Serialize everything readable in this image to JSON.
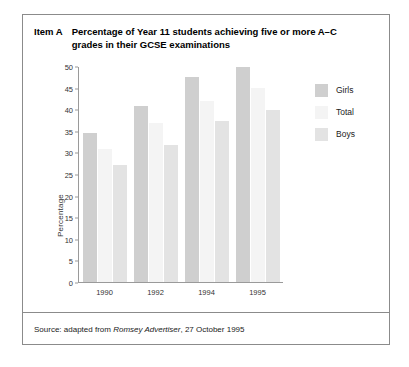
{
  "item": {
    "label": "Item A",
    "title": "Percentage of Year 11 students achieving five or more A–C grades in their GCSE examinations"
  },
  "source": {
    "prefix": "Source: adapted from ",
    "publication": "Romsey Advertiser",
    "suffix": ", 27 October 1995"
  },
  "colors": {
    "girls": "#cfcfcf",
    "total": "#f4f4f4",
    "boys": "#e3e3e3",
    "axis": "#9a9a9a",
    "border": "#8b8b8b"
  },
  "chart_data": {
    "type": "bar",
    "title": "Percentage of Year 11 students achieving five or more A–C grades in their GCSE examinations",
    "xlabel": "",
    "ylabel": "Percentage",
    "ylim": [
      0,
      50
    ],
    "ytick_step": 5,
    "yticks": [
      0,
      5,
      10,
      15,
      20,
      25,
      30,
      35,
      40,
      45,
      50
    ],
    "categories": [
      "1990",
      "1992",
      "1994",
      "1995"
    ],
    "grid": false,
    "legend_position": "right",
    "series": [
      {
        "name": "Girls",
        "values": [
          34.5,
          40.8,
          47.5,
          49.7
        ]
      },
      {
        "name": "Total",
        "values": [
          30.8,
          36.7,
          42.0,
          44.8
        ]
      },
      {
        "name": "Boys",
        "values": [
          27.0,
          31.7,
          37.3,
          39.8
        ]
      }
    ]
  }
}
